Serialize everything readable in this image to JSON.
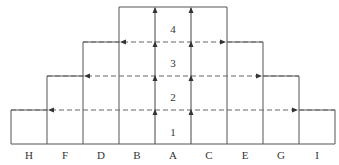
{
  "diagram": {
    "type": "stepped-pyramid",
    "columns": [
      "H",
      "F",
      "D",
      "B",
      "A",
      "C",
      "E",
      "G",
      "I"
    ],
    "levels": [
      "1",
      "2",
      "3",
      "4"
    ],
    "colors": {
      "line": "#555555",
      "text": "#333333",
      "background": "#ffffff"
    }
  }
}
